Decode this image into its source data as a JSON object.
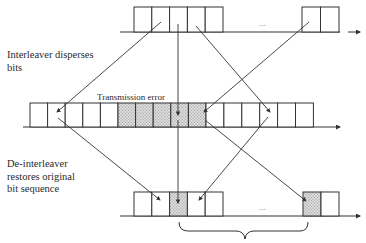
{
  "labels": {
    "interleaver": [
      "Interleaver disperses",
      "bits"
    ],
    "transmission_error": "Transmission error",
    "deinterleaver": [
      "De-interleaver",
      "restores original",
      "bit sequence"
    ],
    "ellipsis_top": "...",
    "ellipsis_bottom": "..."
  },
  "colors": {
    "stroke": "#333333",
    "hatch_bg": "#dcdcdc",
    "hatch_dot": "#8a8a8a"
  },
  "rows": {
    "top": {
      "cells_left": 5,
      "cells_right": 2,
      "hatched": []
    },
    "middle": {
      "cells": 16,
      "hatched": [
        5,
        6,
        7,
        8,
        9
      ]
    },
    "bottom": {
      "cells_left": 5,
      "cells_right": 2,
      "hatched_left": [
        3
      ],
      "hatched_right": [
        1
      ]
    }
  },
  "arrows": {
    "interleave": [
      {
        "from": "top cell 2",
        "to": "middle cell 2"
      },
      {
        "from": "top cell 3",
        "to": "middle cell 8"
      },
      {
        "from": "top cell 4",
        "to": "middle cell 14"
      },
      {
        "from": "top right cell 1",
        "to": "middle cell 9"
      }
    ],
    "deinterleave": [
      {
        "from": "middle cell 2",
        "to": "bottom cell 2"
      },
      {
        "from": "middle cell 8",
        "to": "bottom cell 3"
      },
      {
        "from": "middle cell 14",
        "to": "bottom cell 4"
      },
      {
        "from": "middle cell 9",
        "to": "bottom right cell 1"
      }
    ]
  }
}
